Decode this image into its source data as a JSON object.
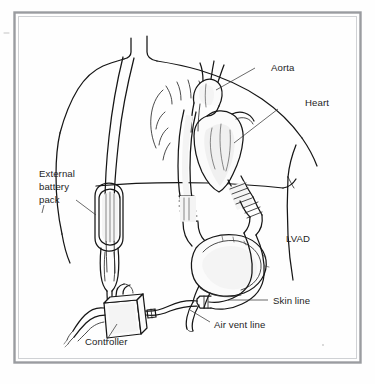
{
  "figure": {
    "frame_color": "#9a9ca0",
    "background_color": "#fefefe",
    "ink_color": "#161616",
    "label_color": "#1d1d1d"
  },
  "labels": {
    "aorta": "Aorta",
    "heart": "Heart",
    "lvad": "LVAD",
    "external_battery_pack_line1": "External",
    "external_battery_pack_line2": "battery",
    "external_battery_pack_line3": "pack",
    "controller": "Controller",
    "skin_line": "Skin line",
    "air_vent_line": "Air vent line"
  },
  "parts": {
    "torso": "patient-torso",
    "heart_organ": "heart-organ",
    "aorta_vessel": "aorta-vessel",
    "outflow_graft": "outflow-graft-tube",
    "inflow_conduit": "inflow-conduit-tube",
    "pump": "lvad-pump-body",
    "battery": "external-battery-pack-device",
    "shoulder_strap": "shoulder-strap",
    "controller_box": "controller-device",
    "percutaneous_lead": "skin-line-cable",
    "vent_tube": "air-vent-line-tube"
  }
}
